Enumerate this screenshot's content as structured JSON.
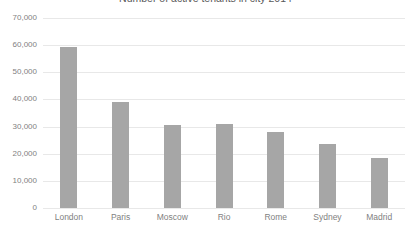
{
  "chart_data": {
    "type": "bar",
    "title": "Number of active tenants in city 2014",
    "xlabel": "",
    "ylabel": "",
    "categories": [
      "London",
      "Paris",
      "Moscow",
      "Rio",
      "Rome",
      "Sydney",
      "Madrid"
    ],
    "values": [
      59500,
      39000,
      30500,
      31000,
      28000,
      23500,
      18500
    ],
    "ylim": [
      0,
      70000
    ],
    "ytick_labels": [
      "70,000",
      "60,000",
      "50,000",
      "40,000",
      "30,000",
      "20,000",
      "10,000",
      "0"
    ],
    "ytick_values": [
      70000,
      60000,
      50000,
      40000,
      30000,
      20000,
      10000,
      0
    ],
    "grid": true,
    "legend": false,
    "bar_color": "#a6a6a6",
    "gridline_color": "#e8e8e8",
    "text_color": "#7f7f7f"
  }
}
